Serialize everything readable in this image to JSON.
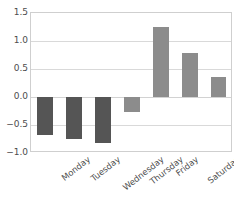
{
  "chart_data": {
    "type": "bar",
    "title": "",
    "subtitle": "",
    "xlabel": "",
    "ylabel": "",
    "categories": [
      "Monday",
      "Tuesday",
      "Wednesday",
      "Thursday",
      "Friday",
      "Saturday",
      "Sunday"
    ],
    "values": [
      -0.68,
      -0.75,
      -0.82,
      -0.27,
      1.25,
      0.79,
      0.35
    ],
    "ylim": [
      -1.0,
      1.5
    ],
    "yticks": [
      1.5,
      1.0,
      0.5,
      0.0,
      -0.5,
      -1.0
    ],
    "ytick_labels": [
      "1.5",
      "1.0",
      "0.5",
      "0.0",
      "−0.5",
      "−1.0"
    ],
    "grid": true,
    "grid_axis": "y",
    "legend": false,
    "legend_position": "none",
    "colors": {
      "negative_bar": "#555555",
      "positive_bar": "#8c8c8c",
      "gridline": "#d9d9d9",
      "axis_frame": "#cfcfcf",
      "tick_label": "#4d4d4d",
      "background": "#ffffff"
    },
    "bars": [
      {
        "label": "Monday",
        "value": -0.68,
        "sign": "negative",
        "color": "#555555"
      },
      {
        "label": "Tuesday",
        "value": -0.75,
        "sign": "negative",
        "color": "#555555"
      },
      {
        "label": "Wednesday",
        "value": -0.82,
        "sign": "negative",
        "color": "#555555"
      },
      {
        "label": "Thursday",
        "value": -0.27,
        "sign": "negative",
        "color": "#8c8c8c"
      },
      {
        "label": "Friday",
        "value": 1.25,
        "sign": "positive",
        "color": "#8c8c8c"
      },
      {
        "label": "Saturday",
        "value": 0.79,
        "sign": "positive",
        "color": "#8c8c8c"
      },
      {
        "label": "Sunday",
        "value": 0.35,
        "sign": "positive",
        "color": "#8c8c8c"
      }
    ]
  }
}
